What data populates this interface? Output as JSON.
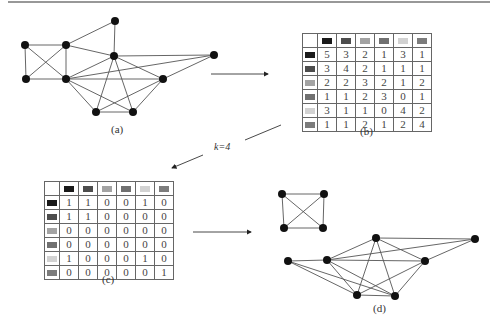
{
  "swatch_colors": [
    "#1a1a1a",
    "#4d4d4d",
    "#a3a3a3",
    "#707070",
    "#d2d2d2",
    "#7c7c7c"
  ],
  "captions": {
    "a": "(a)",
    "b": "(b)",
    "c": "(c)",
    "d": "(d)"
  },
  "k_label": "k=4",
  "graph_a": {
    "nodes": [
      {
        "id": "A",
        "x": 25,
        "y": 45
      },
      {
        "id": "B",
        "x": 66,
        "y": 45
      },
      {
        "id": "C",
        "x": 115,
        "y": 21
      },
      {
        "id": "D",
        "x": 114,
        "y": 56
      },
      {
        "id": "E",
        "x": 26,
        "y": 79
      },
      {
        "id": "F",
        "x": 66,
        "y": 79
      },
      {
        "id": "G",
        "x": 163,
        "y": 79
      },
      {
        "id": "H",
        "x": 214,
        "y": 55
      },
      {
        "id": "I",
        "x": 96,
        "y": 112
      },
      {
        "id": "J",
        "x": 133,
        "y": 112
      }
    ],
    "edges": [
      [
        "A",
        "B"
      ],
      [
        "A",
        "E"
      ],
      [
        "A",
        "F"
      ],
      [
        "B",
        "E"
      ],
      [
        "B",
        "F"
      ],
      [
        "B",
        "C"
      ],
      [
        "B",
        "D"
      ],
      [
        "C",
        "D"
      ],
      [
        "E",
        "F"
      ],
      [
        "F",
        "D"
      ],
      [
        "F",
        "H"
      ],
      [
        "F",
        "G"
      ],
      [
        "F",
        "I"
      ],
      [
        "F",
        "J"
      ],
      [
        "D",
        "H"
      ],
      [
        "D",
        "G"
      ],
      [
        "D",
        "I"
      ],
      [
        "D",
        "J"
      ],
      [
        "G",
        "H"
      ],
      [
        "G",
        "I"
      ],
      [
        "G",
        "J"
      ],
      [
        "I",
        "J"
      ]
    ]
  },
  "matrix_b": {
    "rows": [
      [
        "5",
        "3",
        "2",
        "1",
        "3",
        "1"
      ],
      [
        "3",
        "4",
        "2",
        "1",
        "1",
        "1"
      ],
      [
        "2",
        "2",
        "3",
        "2",
        "1",
        "2"
      ],
      [
        "1",
        "1",
        "2",
        "3",
        "0",
        "1"
      ],
      [
        "3",
        "1",
        "1",
        "0",
        "4",
        "2"
      ],
      [
        "1",
        "1",
        "2",
        "1",
        "2",
        "4"
      ]
    ]
  },
  "matrix_c": {
    "rows": [
      [
        "1",
        "1",
        "0",
        "0",
        "1",
        "0"
      ],
      [
        "1",
        "1",
        "0",
        "0",
        "0",
        "0"
      ],
      [
        "0",
        "0",
        "0",
        "0",
        "0",
        "0"
      ],
      [
        "0",
        "0",
        "0",
        "0",
        "0",
        "0"
      ],
      [
        "1",
        "0",
        "0",
        "0",
        "1",
        "0"
      ],
      [
        "0",
        "0",
        "0",
        "0",
        "0",
        "1"
      ]
    ]
  },
  "graph_d": {
    "nodes": [
      {
        "id": "K1",
        "x": 282,
        "y": 194
      },
      {
        "id": "K2",
        "x": 324,
        "y": 194
      },
      {
        "id": "K3",
        "x": 284,
        "y": 228
      },
      {
        "id": "K4",
        "x": 323,
        "y": 228
      },
      {
        "id": "P",
        "x": 288,
        "y": 261
      },
      {
        "id": "Q",
        "x": 327,
        "y": 260
      },
      {
        "id": "R",
        "x": 376,
        "y": 238
      },
      {
        "id": "S",
        "x": 475,
        "y": 239
      },
      {
        "id": "T",
        "x": 425,
        "y": 261
      },
      {
        "id": "U",
        "x": 357,
        "y": 295
      },
      {
        "id": "V",
        "x": 395,
        "y": 296
      }
    ],
    "edges": [
      [
        "K1",
        "K2"
      ],
      [
        "K1",
        "K3"
      ],
      [
        "K1",
        "K4"
      ],
      [
        "K2",
        "K3"
      ],
      [
        "K2",
        "K4"
      ],
      [
        "K3",
        "K4"
      ],
      [
        "P",
        "Q"
      ],
      [
        "P",
        "U"
      ],
      [
        "P",
        "V"
      ],
      [
        "Q",
        "R"
      ],
      [
        "Q",
        "T"
      ],
      [
        "Q",
        "S"
      ],
      [
        "Q",
        "U"
      ],
      [
        "Q",
        "V"
      ],
      [
        "R",
        "S"
      ],
      [
        "R",
        "T"
      ],
      [
        "R",
        "U"
      ],
      [
        "R",
        "V"
      ],
      [
        "T",
        "S"
      ],
      [
        "T",
        "U"
      ],
      [
        "T",
        "V"
      ],
      [
        "U",
        "V"
      ]
    ]
  },
  "arrows": [
    {
      "x1": 211,
      "y1": 74,
      "x2": 268,
      "y2": 74
    },
    {
      "x1": 193,
      "y1": 232,
      "x2": 251,
      "y2": 232
    }
  ],
  "k_arrow": {
    "seg1": {
      "x1": 281,
      "y1": 125,
      "x2": 245,
      "y2": 140
    },
    "seg2": {
      "x1": 203,
      "y1": 155,
      "x2": 172,
      "y2": 168
    }
  }
}
